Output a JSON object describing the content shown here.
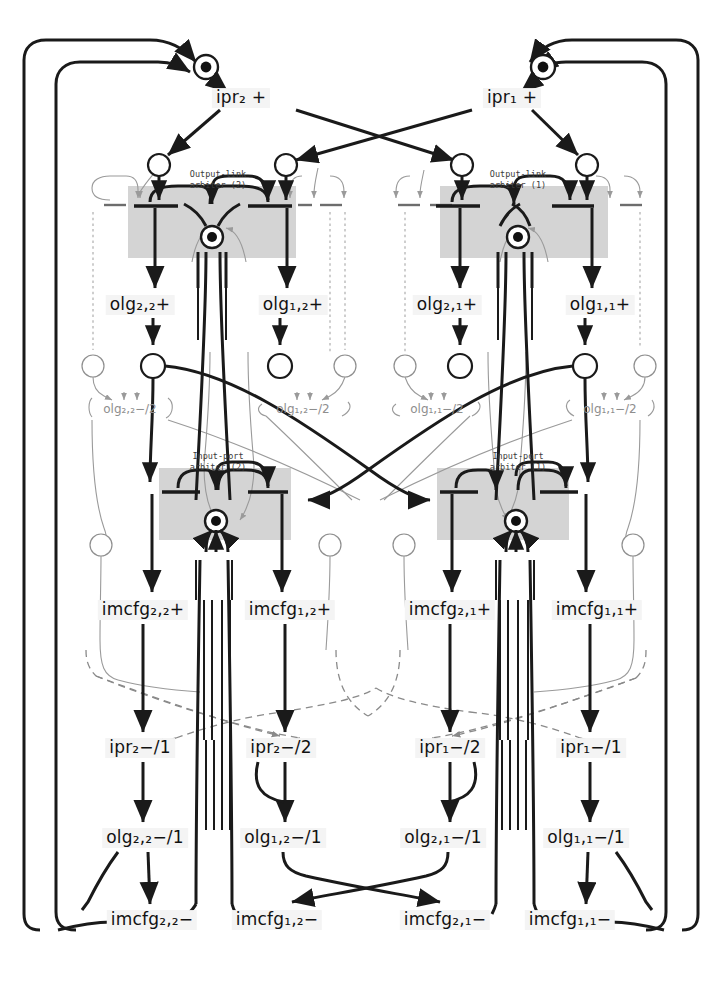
{
  "diagram": {
    "arbiter_boxes": [
      {
        "name": "output-link-arbiter-2",
        "line1": "Output-link",
        "line2": "arbiter (2)",
        "x": 218,
        "y": 180
      },
      {
        "name": "output-link-arbiter-1",
        "line1": "Output-link",
        "line2": "arbiter (1)",
        "x": 518,
        "y": 180
      },
      {
        "name": "input-port-arbiter-2",
        "line1": "Input-port",
        "line2": "arbiter (2)",
        "x": 218,
        "y": 462
      },
      {
        "name": "input-port-arbiter-1",
        "line1": "Input-port",
        "line2": "arbiter (1)",
        "x": 518,
        "y": 462
      }
    ],
    "transitions": [
      {
        "name": "ipr2-plus",
        "text": "ipr₂ +",
        "x": 241,
        "y": 98,
        "style": "transition"
      },
      {
        "name": "ipr1-plus",
        "text": "ipr₁ +",
        "x": 512,
        "y": 98,
        "style": "transition"
      },
      {
        "name": "olg22-plus",
        "text": "olg₂,₂+",
        "x": 140,
        "y": 305,
        "style": "transition"
      },
      {
        "name": "olg12-plus",
        "text": "olg₁,₂+",
        "x": 293,
        "y": 305,
        "style": "transition"
      },
      {
        "name": "olg21-plus",
        "text": "olg₂,₁+",
        "x": 447,
        "y": 305,
        "style": "transition"
      },
      {
        "name": "olg11-plus",
        "text": "olg₁,₁+",
        "x": 600,
        "y": 305,
        "style": "transition"
      },
      {
        "name": "imcfg22-plus",
        "text": "imcfg₂,₂+",
        "x": 143,
        "y": 610,
        "style": "transition"
      },
      {
        "name": "imcfg12-plus",
        "text": "imcfg₁,₂+",
        "x": 290,
        "y": 610,
        "style": "transition"
      },
      {
        "name": "imcfg21-plus",
        "text": "imcfg₂,₁+",
        "x": 450,
        "y": 610,
        "style": "transition"
      },
      {
        "name": "imcfg11-plus",
        "text": "imcfg₁,₁+",
        "x": 597,
        "y": 610,
        "style": "transition"
      },
      {
        "name": "ipr2-minus-1",
        "text": "ipr₂−/1",
        "x": 140,
        "y": 748,
        "style": "transition"
      },
      {
        "name": "ipr2-minus-2",
        "text": "ipr₂−/2",
        "x": 281,
        "y": 748,
        "style": "transition"
      },
      {
        "name": "ipr1-minus-2",
        "text": "ipr₁−/2",
        "x": 450,
        "y": 748,
        "style": "transition"
      },
      {
        "name": "ipr1-minus-1",
        "text": "ipr₁−/1",
        "x": 591,
        "y": 748,
        "style": "transition"
      },
      {
        "name": "olg22-minus-1",
        "text": "olg₂,₂−/1",
        "x": 145,
        "y": 838,
        "style": "transition"
      },
      {
        "name": "olg12-minus-1",
        "text": "olg₁,₂−/1",
        "x": 283,
        "y": 838,
        "style": "transition"
      },
      {
        "name": "olg21-minus-1",
        "text": "olg₂,₁−/1",
        "x": 443,
        "y": 838,
        "style": "transition"
      },
      {
        "name": "olg11-minus-1",
        "text": "olg₁,₁−/1",
        "x": 586,
        "y": 838,
        "style": "transition"
      },
      {
        "name": "imcfg22-minus",
        "text": "imcfg₂,₂−",
        "x": 152,
        "y": 920,
        "style": "transition"
      },
      {
        "name": "imcfg12-minus",
        "text": "imcfg₁,₂−",
        "x": 277,
        "y": 920,
        "style": "transition"
      },
      {
        "name": "imcfg21-minus",
        "text": "imcfg₂,₁−",
        "x": 445,
        "y": 920,
        "style": "transition"
      },
      {
        "name": "imcfg11-minus",
        "text": "imcfg₁,₁−",
        "x": 570,
        "y": 920,
        "style": "transition"
      }
    ],
    "grey_transitions": [
      {
        "name": "olg22-minus-2",
        "text": "olg₂,₂−/2",
        "x": 130,
        "y": 409
      },
      {
        "name": "olg12-minus-2",
        "text": "olg₁,₂−/2",
        "x": 303,
        "y": 409
      },
      {
        "name": "olg11-minus-2",
        "text": "olg₁,₁−/2",
        "x": 437,
        "y": 409
      },
      {
        "name": "olg21-minus-2",
        "text": "olg₁,₁−/2",
        "x": 610,
        "y": 409
      }
    ],
    "colors": {
      "ink": "#1a1a1a",
      "grey_line": "#9a9a9a",
      "arbiter_fill": "#d4d4d4",
      "label_bg": "#f4f4f4",
      "page_bg": "#ffffff"
    },
    "legend": {
      "place_symbol": "circle",
      "marked_place_symbol": "circle-with-token",
      "arc_style_solid": "control flow",
      "arc_style_dashed": "ordering constraint",
      "arc_style_grey": "secondary flow"
    }
  }
}
